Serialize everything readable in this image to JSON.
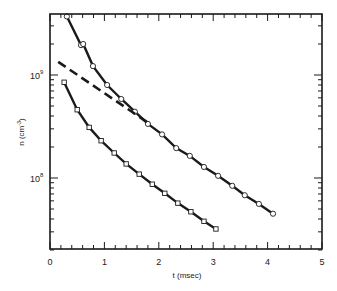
{
  "chart_data": {
    "type": "scatter",
    "title": "",
    "xlabel": "t (msec)",
    "ylabel": "n (cm⁻³)",
    "yscale": "log",
    "xlim": [
      0,
      5
    ],
    "ylim": [
      20000000.0,
      3900000000.0
    ],
    "grid": false,
    "legend": null,
    "x_ticks": [
      0,
      1,
      2,
      3,
      4,
      5
    ],
    "x_tick_labels": [
      "0",
      "1",
      "2",
      "3",
      "4",
      "5"
    ],
    "x_minor_step": 0.2,
    "y_ticks": [
      100000000.0,
      1000000000.0
    ],
    "y_tick_labels": [
      "10⁸",
      "10⁹"
    ],
    "series": [
      {
        "name": "upper (circles)",
        "marker": "circle",
        "line": "solid",
        "x": [
          0.31,
          0.57,
          0.61,
          0.79,
          1.05,
          1.31,
          1.56,
          1.8,
          2.06,
          2.32,
          2.57,
          2.83,
          3.09,
          3.35,
          3.58,
          3.84,
          4.1
        ],
        "y": [
          3700000000.0,
          1950000000.0,
          2000000000.0,
          1220000000.0,
          800000000.0,
          585000000.0,
          440000000.0,
          335000000.0,
          265000000.0,
          195000000.0,
          164000000.0,
          128000000.0,
          105000000.0,
          84000000.0,
          68000000.0,
          56000000.0,
          45000000.0
        ]
      },
      {
        "name": "lower (squares)",
        "marker": "square",
        "line": "solid",
        "x": [
          0.26,
          0.5,
          0.72,
          0.94,
          1.18,
          1.4,
          1.64,
          1.88,
          2.11,
          2.35,
          2.59,
          2.83,
          3.05
        ],
        "y": [
          850000000.0,
          460000000.0,
          310000000.0,
          230000000.0,
          175000000.0,
          137000000.0,
          109000000.0,
          87000000.0,
          71000000.0,
          57000000.0,
          47000000.0,
          38000000.0,
          32000000.0
        ]
      },
      {
        "name": "dashed extrapolation",
        "marker": "none",
        "line": "dashed",
        "x": [
          0.15,
          1.84
        ],
        "y": [
          1340000000.0,
          334000000.0
        ]
      }
    ]
  },
  "axes": {
    "x_title": "t (msec)",
    "y_title_base": "n (cm",
    "y_title_exp": "-3",
    "y_title_close": ")",
    "x_labels": [
      "0",
      "1",
      "2",
      "3",
      "4",
      "5"
    ],
    "y_label_1e9_base": "10",
    "y_label_1e9_exp": "9",
    "y_label_1e8_base": "10",
    "y_label_1e8_exp": "8"
  },
  "colors": {
    "ink": "#1a1a1a",
    "background": "#ffffff"
  }
}
